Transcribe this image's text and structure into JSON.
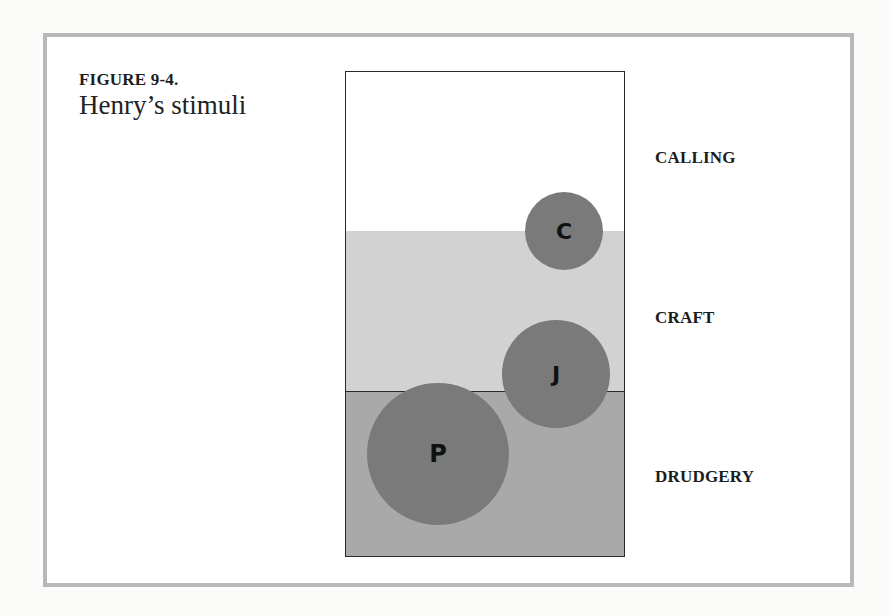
{
  "figure": {
    "number": "FIGURE 9-4.",
    "title": "Henry’s stimuli"
  },
  "bands": [
    {
      "id": "calling",
      "label": "CALLING",
      "color": "#ffffff"
    },
    {
      "id": "craft",
      "label": "CRAFT",
      "color": "#d2d2d2"
    },
    {
      "id": "drudgery",
      "label": "DRUDGERY",
      "color": "#a9a9a9"
    }
  ],
  "circles": [
    {
      "label": "C",
      "band": "boundary calling/craft",
      "size": "small"
    },
    {
      "label": "J",
      "band": "boundary craft/drudgery",
      "size": "medium"
    },
    {
      "label": "P",
      "band": "drudgery",
      "size": "large"
    }
  ],
  "colors": {
    "circle": "#7a7a7a",
    "frame": "#b8b8b8"
  }
}
